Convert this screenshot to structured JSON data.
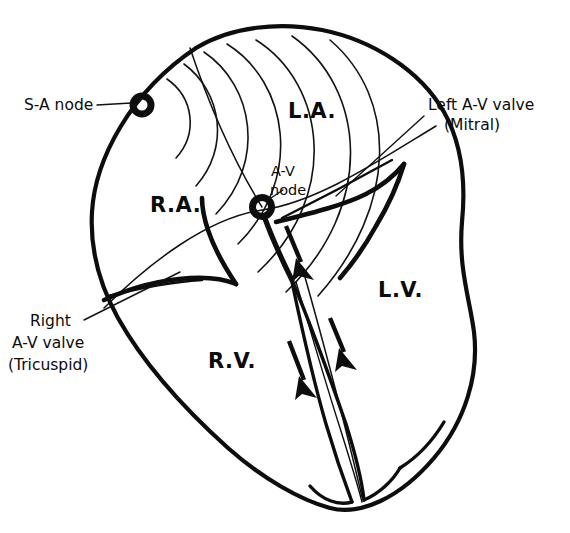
{
  "figure": {
    "background_color": "#ffffff",
    "ink_color": "#0d0d0d"
  },
  "chambers": [
    {
      "id": "right-atrium",
      "abbr": "R.A.",
      "x": 150,
      "y": 212
    },
    {
      "id": "left-atrium",
      "abbr": "L.A.",
      "x": 288,
      "y": 118
    },
    {
      "id": "right-ventricle",
      "abbr": "R.V.",
      "x": 208,
      "y": 368
    },
    {
      "id": "left-ventricle",
      "abbr": "L.V.",
      "x": 378,
      "y": 297
    }
  ],
  "nodes": [
    {
      "id": "sa-node",
      "label": "S-A node",
      "label_x": 24,
      "label_y": 110,
      "marker_x": 142,
      "marker_y": 105,
      "leader_from_x": 97,
      "leader_from_y": 105,
      "leader_to_x": 131,
      "leader_to_y": 103
    },
    {
      "id": "av-node",
      "label_line1": "A-V",
      "label_line2": "node",
      "label_x": 271,
      "label_y": 176,
      "label2_x": 270,
      "label2_y": 195,
      "marker_x": 262,
      "marker_y": 207,
      "leader_from_x": 268,
      "leader_from_y": 200,
      "leader_to_x": 283,
      "leader_to_y": 190
    }
  ],
  "valves": [
    {
      "id": "mitral-valve",
      "line1": "Left A-V valve",
      "line2": "(Mitral)",
      "line1_x": 428,
      "line1_y": 110,
      "line2_x": 444,
      "line2_y": 130,
      "leader_from_x": 424,
      "leader_from_y": 116,
      "leader_to_x": 336,
      "leader_to_y": 196
    },
    {
      "id": "tricuspid-valve",
      "line1": "Right",
      "line2": "A-V valve",
      "line3": "(Tricuspid)",
      "line1_x": 30,
      "line1_y": 326,
      "line2_x": 12,
      "line2_y": 348,
      "line3_x": 8,
      "line3_y": 370,
      "leader_from_x": 84,
      "leader_from_y": 320,
      "leader_to_x": 180,
      "leader_to_y": 272
    }
  ],
  "impulse_arrows": [
    {
      "id": "arrow-his-bundle",
      "x1": 286,
      "y1": 226,
      "x2": 305,
      "y2": 272
    },
    {
      "id": "arrow-left-branch",
      "x1": 330,
      "y1": 318,
      "x2": 348,
      "y2": 362
    },
    {
      "id": "arrow-right-branch",
      "x1": 289,
      "y1": 341,
      "x2": 309,
      "y2": 392
    }
  ],
  "conduction_wavefronts": {
    "origin": "sa-node",
    "count": 6,
    "description": "Concentric arcs spreading from the S-A node across the atria"
  }
}
